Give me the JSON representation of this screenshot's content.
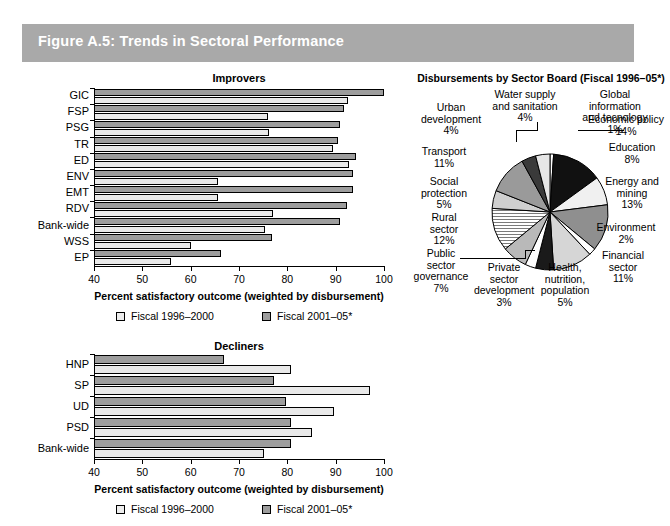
{
  "figure": {
    "title": "Figure A.5: Trends in Sectoral Performance",
    "banner_color": "#a9a9a9"
  },
  "legend": {
    "series1_label": "Fiscal 1996–2000",
    "series2_label": "Fiscal 2001–05*",
    "series1_color": "#ededed",
    "series2_color": "#9d9d9d"
  },
  "axis": {
    "xlabel": "Percent satisfactory outcome (weighted by disbursement)",
    "ticks": [
      "40",
      "50",
      "60",
      "70",
      "80",
      "90",
      "100"
    ]
  },
  "improvers": {
    "title": "Improvers",
    "chart_data": {
      "type": "bar",
      "title": "Improvers",
      "xlabel": "Percent satisfactory outcome (weighted by disbursement)",
      "ylabel": "",
      "xlim": [
        40,
        100
      ],
      "grid": false,
      "orientation": "horizontal",
      "legend_position": "bottom",
      "categories": [
        "GIC",
        "FSP",
        "PSG",
        "TR",
        "ED",
        "ENV",
        "EMT",
        "RDV",
        "Bank-wide",
        "WSS",
        "EP"
      ],
      "series": [
        {
          "name": "Fiscal 1996–2000",
          "values": [
            92.5,
            76,
            76.3,
            89.5,
            92.8,
            65.7,
            65.7,
            77,
            75.3,
            60,
            56
          ]
        },
        {
          "name": "Fiscal 2001–05*",
          "values": [
            100,
            91.7,
            90.8,
            90.5,
            94.3,
            93.5,
            93.5,
            92.3,
            90.8,
            76.8,
            66.2
          ]
        }
      ]
    }
  },
  "decliners": {
    "title": "Decliners",
    "chart_data": {
      "type": "bar",
      "title": "Decliners",
      "xlabel": "Percent satisfactory outcome (weighted by disbursement)",
      "ylabel": "",
      "xlim": [
        40,
        100
      ],
      "grid": false,
      "orientation": "horizontal",
      "legend_position": "bottom",
      "categories": [
        "HNP",
        "SP",
        "UD",
        "PSD",
        "Bank-wide"
      ],
      "series": [
        {
          "name": "Fiscal 1996–2000",
          "values": [
            80.8,
            97.2,
            89.7,
            85.2,
            75.2
          ]
        },
        {
          "name": "Fiscal 2001–05*",
          "values": [
            66.8,
            77.2,
            79.8,
            80.8,
            80.8
          ]
        }
      ]
    }
  },
  "pie": {
    "title": "Disbursements by Sector Board (Fiscal 1996–05*)",
    "chart_data": {
      "type": "pie",
      "title": "Disbursements by Sector Board (Fiscal 1996–05*)",
      "labels": [
        "Global information and tecnology",
        "Economic policy",
        "Education",
        "Energy and mining",
        "Environment",
        "Financial sector",
        "Health, nutrition, population",
        "Private sector development",
        "Public sector governance",
        "Rural sector",
        "Social protection",
        "Transport",
        "Urban development",
        "Water supply and sanitation"
      ],
      "values": [
        1,
        14,
        8,
        13,
        2,
        11,
        5,
        3,
        7,
        12,
        5,
        11,
        4,
        4
      ],
      "unit": "%"
    },
    "labels": {
      "water_supply": "Water supply\nand sanitation\n4%",
      "global_info": "Global\ninformation\nand tecnology\n1%",
      "urban_development": "Urban\ndevelopment\n4%",
      "transport": "Transport\n11%",
      "social_protection": "Social\nprotection\n5%",
      "rural_sector": "Rural\nsector\n12%",
      "public_sector_governance": "Public\nsector\ngovernance\n7%",
      "private_sector_development": "Private\nsector\ndevelopment\n3%",
      "health_nutrition_population": "Health,\nnutrition,\npopulation\n5%",
      "financial_sector": "Financial\nsector\n11%",
      "environment": "Environment\n2%",
      "energy_and_mining": "Energy and\nmining\n13%",
      "education": "Education\n8%",
      "economic_policy": "Economic policy\n14%"
    }
  }
}
